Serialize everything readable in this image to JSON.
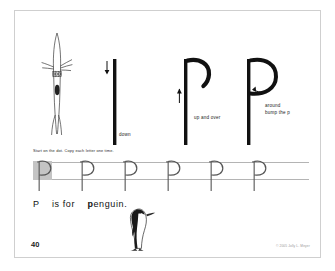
{
  "page": {
    "number": "40",
    "copyright": "© 2005 Jolly L. Meyer"
  },
  "demo": {
    "illustration_name": "diving-penguin",
    "letters": [
      {
        "glyph": "P",
        "stage": "downstroke"
      },
      {
        "glyph": "P",
        "stage": "up-and-over"
      },
      {
        "glyph": "P",
        "stage": "complete"
      }
    ],
    "captions": {
      "down": "down",
      "up_and_over": "up and over",
      "around": "around",
      "bump_the_p": "bump the p"
    }
  },
  "instruction": {
    "text": "Start on the dot.  Copy each letter one time."
  },
  "practice": {
    "letter": "P",
    "count": 6,
    "start_box_label": "P",
    "positions": [
      20,
      63,
      106,
      149,
      192,
      235
    ]
  },
  "sentence": {
    "prefix": "P",
    "middle": "is for",
    "word_bold": "p",
    "word_rest": "enguin.",
    "illustration_name": "standing-penguin"
  },
  "colors": {
    "ink": "#111111",
    "rule": "#9a9a9a",
    "practice_rule": "#b4b4b4",
    "start_box": "#c4c4c4",
    "caption": "#1b1b1b",
    "page_border": "#cfcfcf"
  }
}
